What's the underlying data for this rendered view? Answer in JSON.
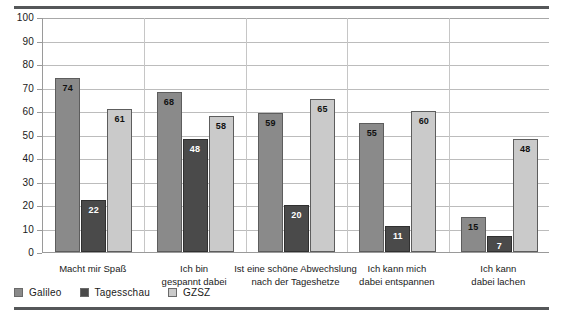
{
  "chart_data": {
    "type": "bar",
    "title": "",
    "xlabel": "",
    "ylabel": "",
    "ylim": [
      0,
      100
    ],
    "yticks": [
      0,
      10,
      20,
      30,
      40,
      50,
      60,
      70,
      80,
      90,
      100
    ],
    "grid": true,
    "legend_position": "bottom-left",
    "categories": [
      "Macht mir Spaß",
      "Ich bin\ngespannt dabei",
      "Ist eine schöne Abwechslung\nnach der Tageshetze",
      "Ich kann mich\ndabei entspannen",
      "Ich kann\ndabei lachen"
    ],
    "category_lines": [
      [
        "Macht mir Spaß"
      ],
      [
        "Ich bin",
        "gespannt dabei"
      ],
      [
        "Ist eine schöne Abwechslung",
        "nach der Tageshetze"
      ],
      [
        "Ich kann mich",
        "dabei entspannen"
      ],
      [
        "Ich kann",
        "dabei lachen"
      ]
    ],
    "series": [
      {
        "name": "Galileo",
        "color": "#8a8a8a",
        "values": [
          74,
          68,
          59,
          55,
          15
        ]
      },
      {
        "name": "Tagesschau",
        "color": "#4a4a4a",
        "values": [
          22,
          48,
          20,
          11,
          7
        ]
      },
      {
        "name": "GZSZ",
        "color": "#cacaca",
        "values": [
          61,
          58,
          65,
          60,
          48
        ]
      }
    ]
  },
  "legend": {
    "items": [
      {
        "label": "Galileo",
        "swatch": "#8a8a8a"
      },
      {
        "label": "Tagesschau",
        "swatch": "#4a4a4a"
      },
      {
        "label": "GZSZ",
        "swatch": "#cacaca"
      }
    ]
  }
}
